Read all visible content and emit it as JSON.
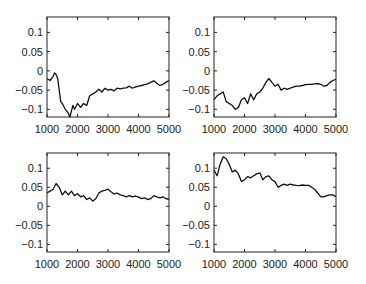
{
  "figure": {
    "layout": "2x2 subplots",
    "background": "#ffffff",
    "line_color": "#111111"
  },
  "chart_data": [
    {
      "type": "line",
      "position": "top-left",
      "title": "",
      "xlabel": "",
      "ylabel": "",
      "xlim": [
        1000,
        5000
      ],
      "ylim": [
        -0.12,
        0.14
      ],
      "xticks": [
        1000,
        2000,
        3000,
        4000,
        5000
      ],
      "xtick_labels": [
        "1000",
        "2000",
        "3000",
        "4000",
        "5000"
      ],
      "yticks": [
        0.1,
        0.05,
        0,
        -0.05,
        -0.1
      ],
      "ytick_labels": [
        "0.1",
        "0.05",
        "0",
        "−0.05",
        "−0.1"
      ],
      "grid": false,
      "series": [
        {
          "name": "series1",
          "x": [
            1000,
            1100,
            1200,
            1250,
            1300,
            1350,
            1400,
            1450,
            1500,
            1600,
            1700,
            1750,
            1800,
            1850,
            1900,
            2000,
            2100,
            2200,
            2300,
            2400,
            2500,
            2600,
            2700,
            2800,
            2900,
            3000,
            3100,
            3200,
            3300,
            3400,
            3500,
            3600,
            3700,
            3800,
            3900,
            4000,
            4100,
            4200,
            4300,
            4400,
            4500,
            4600,
            4700,
            4800,
            4900,
            5000
          ],
          "values": [
            -0.02,
            -0.025,
            -0.015,
            -0.005,
            -0.01,
            -0.02,
            -0.05,
            -0.08,
            -0.085,
            -0.1,
            -0.11,
            -0.12,
            -0.105,
            -0.09,
            -0.1,
            -0.085,
            -0.095,
            -0.085,
            -0.09,
            -0.065,
            -0.06,
            -0.055,
            -0.048,
            -0.055,
            -0.045,
            -0.05,
            -0.048,
            -0.052,
            -0.045,
            -0.047,
            -0.045,
            -0.044,
            -0.04,
            -0.045,
            -0.042,
            -0.04,
            -0.038,
            -0.036,
            -0.034,
            -0.03,
            -0.026,
            -0.032,
            -0.038,
            -0.035,
            -0.03,
            -0.025
          ]
        }
      ]
    },
    {
      "type": "line",
      "position": "top-right",
      "title": "",
      "xlabel": "",
      "ylabel": "",
      "xlim": [
        1000,
        5000
      ],
      "ylim": [
        -0.12,
        0.14
      ],
      "xticks": [
        1000,
        2000,
        3000,
        4000,
        5000
      ],
      "xtick_labels": [
        "1000",
        "2000",
        "3000",
        "4000",
        "5000"
      ],
      "yticks": [
        0.1,
        0.05,
        0,
        -0.05,
        -0.1
      ],
      "ytick_labels": [
        "0.1",
        "0.05",
        "0",
        "−0.05",
        "−0.1"
      ],
      "grid": false,
      "series": [
        {
          "name": "series1",
          "x": [
            1000,
            1100,
            1200,
            1300,
            1400,
            1500,
            1600,
            1700,
            1800,
            1900,
            2000,
            2100,
            2200,
            2300,
            2400,
            2500,
            2600,
            2700,
            2800,
            2900,
            3000,
            3100,
            3200,
            3300,
            3400,
            3500,
            3600,
            3700,
            3800,
            3900,
            4000,
            4100,
            4200,
            4300,
            4400,
            4500,
            4600,
            4700,
            4800,
            4900,
            5000
          ],
          "values": [
            -0.075,
            -0.065,
            -0.06,
            -0.055,
            -0.08,
            -0.085,
            -0.09,
            -0.1,
            -0.095,
            -0.075,
            -0.07,
            -0.085,
            -0.06,
            -0.075,
            -0.06,
            -0.055,
            -0.045,
            -0.03,
            -0.02,
            -0.03,
            -0.04,
            -0.035,
            -0.05,
            -0.045,
            -0.048,
            -0.045,
            -0.042,
            -0.04,
            -0.04,
            -0.038,
            -0.036,
            -0.035,
            -0.035,
            -0.034,
            -0.033,
            -0.035,
            -0.04,
            -0.038,
            -0.03,
            -0.025,
            -0.022
          ]
        }
      ]
    },
    {
      "type": "line",
      "position": "bottom-left",
      "title": "",
      "xlabel": "",
      "ylabel": "",
      "xlim": [
        1000,
        5000
      ],
      "ylim": [
        -0.12,
        0.14
      ],
      "xticks": [
        1000,
        2000,
        3000,
        4000,
        5000
      ],
      "xtick_labels": [
        "1000",
        "2000",
        "3000",
        "4000",
        "5000"
      ],
      "yticks": [
        0.1,
        0.05,
        0,
        -0.05,
        -0.1
      ],
      "ytick_labels": [
        "0.1",
        "0.05",
        "0",
        "−0.05",
        "−0.1"
      ],
      "grid": false,
      "series": [
        {
          "name": "series1",
          "x": [
            1000,
            1100,
            1200,
            1300,
            1400,
            1500,
            1600,
            1700,
            1800,
            1900,
            2000,
            2100,
            2200,
            2300,
            2400,
            2500,
            2600,
            2700,
            2800,
            2900,
            3000,
            3100,
            3200,
            3300,
            3400,
            3500,
            3600,
            3700,
            3800,
            3900,
            4000,
            4100,
            4200,
            4300,
            4400,
            4500,
            4600,
            4700,
            4800,
            4900,
            5000
          ],
          "values": [
            0.035,
            0.04,
            0.045,
            0.06,
            0.05,
            0.03,
            0.04,
            0.03,
            0.04,
            0.028,
            0.033,
            0.025,
            0.028,
            0.018,
            0.022,
            0.014,
            0.02,
            0.035,
            0.04,
            0.042,
            0.045,
            0.038,
            0.032,
            0.035,
            0.03,
            0.028,
            0.025,
            0.028,
            0.025,
            0.027,
            0.024,
            0.02,
            0.022,
            0.018,
            0.02,
            0.028,
            0.025,
            0.022,
            0.025,
            0.02,
            0.018
          ]
        }
      ]
    },
    {
      "type": "line",
      "position": "bottom-right",
      "title": "",
      "xlabel": "",
      "ylabel": "",
      "xlim": [
        1000,
        5000
      ],
      "ylim": [
        -0.12,
        0.14
      ],
      "xticks": [
        1000,
        2000,
        3000,
        4000,
        5000
      ],
      "xtick_labels": [
        "1000",
        "2000",
        "3000",
        "4000",
        "5000"
      ],
      "yticks": [
        0.1,
        0.05,
        0,
        -0.05,
        -0.1
      ],
      "ytick_labels": [
        "0.1",
        "0.05",
        "0",
        "−0.05",
        "−0.1"
      ],
      "grid": false,
      "series": [
        {
          "name": "series1",
          "x": [
            1000,
            1100,
            1200,
            1300,
            1400,
            1500,
            1600,
            1700,
            1800,
            1900,
            2000,
            2100,
            2200,
            2300,
            2400,
            2500,
            2600,
            2700,
            2800,
            2900,
            3000,
            3100,
            3200,
            3300,
            3400,
            3500,
            3600,
            3700,
            3800,
            3900,
            4000,
            4100,
            4200,
            4300,
            4400,
            4500,
            4600,
            4700,
            4800,
            4900,
            5000
          ],
          "values": [
            0.095,
            0.08,
            0.11,
            0.13,
            0.125,
            0.11,
            0.09,
            0.095,
            0.085,
            0.065,
            0.07,
            0.078,
            0.075,
            0.08,
            0.085,
            0.088,
            0.07,
            0.078,
            0.08,
            0.07,
            0.065,
            0.05,
            0.055,
            0.058,
            0.055,
            0.058,
            0.056,
            0.055,
            0.054,
            0.056,
            0.055,
            0.055,
            0.05,
            0.045,
            0.035,
            0.025,
            0.025,
            0.028,
            0.03,
            0.03,
            0.025
          ]
        }
      ]
    }
  ]
}
